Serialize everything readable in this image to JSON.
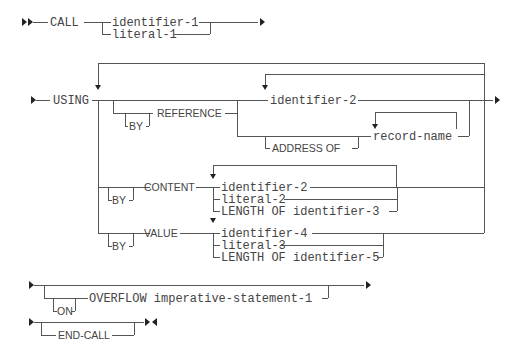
{
  "diagram": {
    "colors": {
      "line": "#555555",
      "text": "#444444",
      "arrow": "#222222",
      "background": "#ffffff"
    },
    "row_call": {
      "keyword": "CALL",
      "options": [
        "identifier-1",
        "literal-1"
      ]
    },
    "row_using": {
      "keyword": "USING",
      "by_reference": {
        "by": "BY",
        "keyword": "REFERENCE",
        "identifier": "identifier-2",
        "address_of": "ADDRESS OF",
        "record_name": "record-name"
      },
      "by_content": {
        "by": "BY",
        "keyword": "CONTENT",
        "options": [
          "identifier-2",
          "literal-2",
          "LENGTH OF identifier-3"
        ]
      },
      "by_value": {
        "by": "BY",
        "keyword": "VALUE",
        "options": [
          "identifier-4",
          "literal-3",
          "LENGTH OF identifier-5"
        ]
      }
    },
    "row_overflow": {
      "on": "ON",
      "keyword": "OVERFLOW imperative-statement-1"
    },
    "row_end": {
      "keyword": "END-CALL"
    }
  }
}
